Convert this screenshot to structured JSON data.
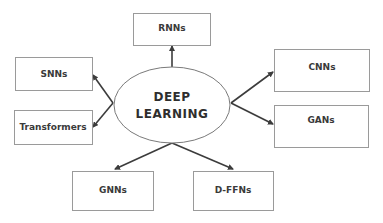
{
  "diagram": {
    "center": {
      "line1": "DEEP",
      "line2": "LEARNING"
    },
    "nodes": [
      {
        "id": "rnns",
        "label": "RNNs"
      },
      {
        "id": "snns",
        "label": "SNNs"
      },
      {
        "id": "transformers",
        "label": "Transformers"
      },
      {
        "id": "cnns",
        "label": "CNNs"
      },
      {
        "id": "gans",
        "label": "GANs"
      },
      {
        "id": "gnns",
        "label": "GNNs"
      },
      {
        "id": "dffns",
        "label": "D-FFNs"
      }
    ],
    "edges": [
      {
        "from": "DEEP LEARNING",
        "to": "RNNs"
      },
      {
        "from": "DEEP LEARNING",
        "to": "SNNs"
      },
      {
        "from": "DEEP LEARNING",
        "to": "Transformers"
      },
      {
        "from": "DEEP LEARNING",
        "to": "CNNs"
      },
      {
        "from": "DEEP LEARNING",
        "to": "GANs"
      },
      {
        "from": "DEEP LEARNING",
        "to": "GNNs"
      },
      {
        "from": "DEEP LEARNING",
        "to": "D-FFNs"
      }
    ],
    "colors": {
      "box_stroke": "#9a9a9a",
      "edge": "#3c3c3c",
      "text": "#3a3a3a"
    }
  }
}
